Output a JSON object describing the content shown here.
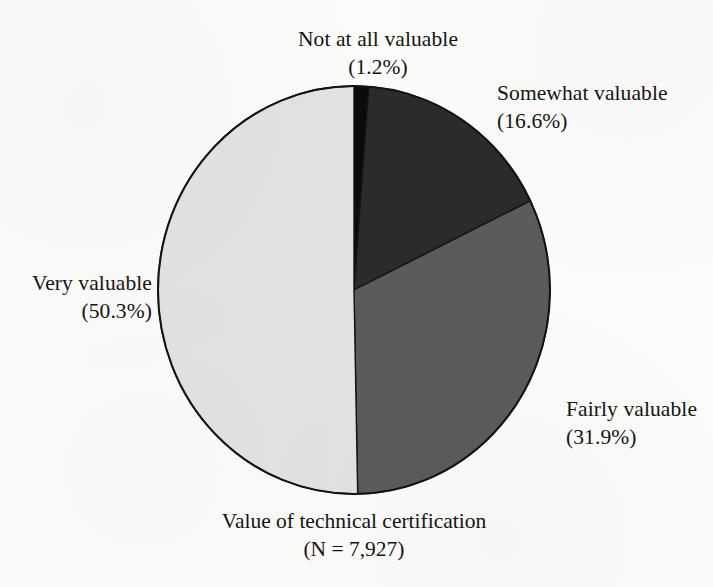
{
  "chart_data": {
    "type": "pie",
    "title": "Value of technical certification",
    "subtitle": "(N = 7,927)",
    "sample_size": "7,927",
    "categories": [
      "Not at all valuable",
      "Somewhat valuable",
      "Fairly valuable",
      "Very valuable"
    ],
    "values": [
      1.2,
      16.6,
      31.9,
      50.3
    ],
    "value_labels": [
      "(1.2%)",
      "(16.6%)",
      "(31.9%)",
      "(50.3%)"
    ],
    "units": "percent",
    "start_angle_deg": 0,
    "direction": "clockwise",
    "legend": "none",
    "grid": false,
    "colors": [
      "#0b0b0b",
      "#2b2b2b",
      "#5b5b5b",
      "#e2e2e0"
    ],
    "stroke_color": "#141414",
    "background": "#fbfbfa",
    "slices": [
      {
        "label": "Not at all valuable",
        "percent_label": "(1.2%)",
        "value": 1.2,
        "color": "#0b0b0b"
      },
      {
        "label": "Somewhat valuable",
        "percent_label": "(16.6%)",
        "value": 16.6,
        "color": "#2b2b2b"
      },
      {
        "label": "Fairly valuable",
        "percent_label": "(31.9%)",
        "value": 31.9,
        "color": "#5b5b5b"
      },
      {
        "label": "Very valuable",
        "percent_label": "(50.3%)",
        "value": 50.3,
        "color": "#e2e2e0"
      }
    ]
  },
  "labels": {
    "not_at_all": {
      "name": "Not at all valuable",
      "percent": "(1.2%)"
    },
    "somewhat": {
      "name": "Somewhat valuable",
      "percent": "(16.6%)"
    },
    "fairly": {
      "name": "Fairly valuable",
      "percent": "(31.9%)"
    },
    "very": {
      "name": "Very valuable",
      "percent": "(50.3%)"
    }
  },
  "caption": {
    "title": "Value of technical certification",
    "n_label": "(N = 7,927)"
  },
  "geometry": {
    "center_x": 354,
    "center_y": 290,
    "radius_x": 196,
    "radius_y": 204
  }
}
